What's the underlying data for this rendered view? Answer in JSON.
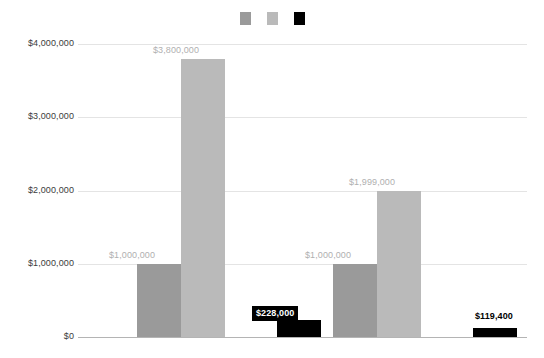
{
  "chart_data": {
    "type": "bar",
    "title": "",
    "subtitle": "",
    "xlabel": "",
    "ylabel": "",
    "ylim": [
      0,
      4000000
    ],
    "grid": true,
    "legend_position": "top-center",
    "categories": [
      "Group 1",
      "Group 2"
    ],
    "tick_labels": [
      "$0",
      "$1,000,000",
      "$2,000,000",
      "$3,000,000",
      "$4,000,000"
    ],
    "tick_values": [
      0,
      1000000,
      2000000,
      3000000,
      4000000
    ],
    "series": [
      {
        "name": "Series 1",
        "color": "#9a9a9a",
        "values": [
          1000000,
          1000000
        ],
        "labels": [
          "$1,000,000",
          "$1,000,000"
        ]
      },
      {
        "name": "Series 2",
        "color": "#bababa",
        "values": [
          3800000,
          1999000
        ],
        "labels": [
          "$3,800,000",
          "$1,999,000"
        ]
      },
      {
        "name": "Series 3",
        "color": "#000000",
        "values": [
          228000,
          119400
        ],
        "labels": [
          "$228,000",
          "$119,400"
        ]
      }
    ]
  },
  "legend": {
    "items": [
      {
        "swatch_color": "#9a9a9a",
        "label": ""
      },
      {
        "swatch_color": "#bababa",
        "label": ""
      },
      {
        "swatch_color": "#000000",
        "label": ""
      }
    ]
  },
  "colors": {
    "background": "#ffffff",
    "gridline": "#e4e4e4",
    "axis_line": "#b4b4b4",
    "tick_text": "#3c3c3c",
    "gray_label_text": "#b0b0b0",
    "boxed_label_bg": "#000000",
    "boxed_label_text": "#ffffff",
    "dark_label_text": "#000000"
  }
}
